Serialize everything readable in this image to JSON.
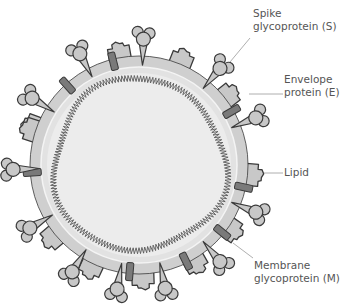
{
  "diagram": {
    "center": [
      139,
      165
    ],
    "outer_radius": 109,
    "lipid_inner_radius": 98,
    "core_radius": 92,
    "colors": {
      "stroke": "#3a3a3a",
      "lipid": "#cfcfcf",
      "core": "#ececec",
      "protein_fill": "#c8c8c8",
      "envelope_fill": "#7a7a7a",
      "rna": "#5a5a5a",
      "leader": "#9a9a9a",
      "label": "#555555"
    },
    "spikes_deg": [
      -148,
      -118,
      -88,
      -50,
      -22,
      22,
      50,
      78,
      100,
      122,
      150,
      178
    ],
    "membrane_deg": [
      -160,
      -100,
      -68,
      -38,
      5,
      35,
      60,
      88,
      115,
      140,
      198
    ],
    "envelope_deg": [
      -132,
      -104,
      -30,
      12,
      39,
      64,
      95,
      176
    ]
  },
  "labels": [
    {
      "id": "spike",
      "text": "Spike\nglycoprotein (S)",
      "x": 253,
      "y": 7,
      "line": [
        [
          250,
          38
        ],
        [
          230,
          62
        ]
      ]
    },
    {
      "id": "envelope",
      "text": "Envelope\nprotein (E)",
      "x": 284,
      "y": 73,
      "line": [
        [
          283,
          94
        ],
        [
          249,
          94
        ]
      ]
    },
    {
      "id": "lipid",
      "text": "Lipid",
      "x": 284,
      "y": 166,
      "line": [
        [
          283,
          173
        ],
        [
          247,
          173
        ]
      ]
    },
    {
      "id": "membrane",
      "text": "Membrane\nglycoprotein (M)",
      "x": 254,
      "y": 259,
      "line": [
        [
          253,
          258
        ],
        [
          233,
          243
        ]
      ]
    }
  ]
}
